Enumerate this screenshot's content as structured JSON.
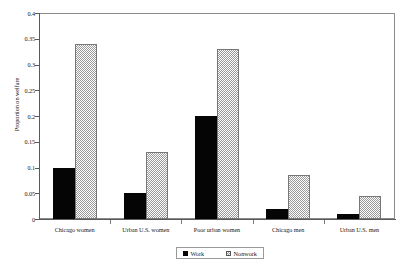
{
  "chart_data": {
    "type": "bar",
    "title": "",
    "subtitle": "",
    "xlabel": "",
    "ylabel": "Proportion on welfare",
    "categories": [
      "Chicago women",
      "Urban U.S. women",
      "Poor urban women",
      "Chicago men",
      "Urban U.S. men"
    ],
    "series": [
      {
        "name": "Work",
        "values": [
          0.1,
          0.05,
          0.2,
          0.02,
          0.01
        ]
      },
      {
        "name": "Nonwork",
        "values": [
          0.34,
          0.13,
          0.33,
          0.085,
          0.045
        ]
      }
    ],
    "ylim": [
      0,
      0.4
    ],
    "ytick_labels": [
      "0",
      "0.05",
      "0.1",
      "0.15",
      "0.2",
      "0.25",
      "0.3",
      "0.35",
      "0.4"
    ],
    "ytick_values": [
      0,
      0.05,
      0.1,
      0.15,
      0.2,
      0.25,
      0.3,
      0.35,
      0.4
    ],
    "grid": false,
    "legend_position": "bottom-center",
    "legend_entries": [
      "Work",
      "Nonwork"
    ],
    "colors": {
      "work": "#050505",
      "nonwork_fill": "#9a9a9a",
      "nonwork_border": "#777777",
      "axis": "#5a5a5a",
      "frame": "#8a8a8a",
      "text": "#1a1a1a",
      "background": "#ffffff"
    }
  }
}
